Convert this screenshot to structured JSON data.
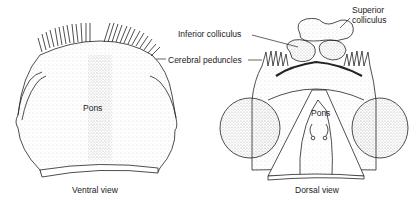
{
  "figure": {
    "ventral": {
      "caption": "Ventral view",
      "pons_label": "Pons"
    },
    "dorsal": {
      "caption": "Dorsal view",
      "pons_label": "Pons"
    },
    "callouts": {
      "superior_line1": "Superior",
      "superior_line2": "colliculus",
      "inferior": "Inferior colliculus",
      "cerebral": "Cerebral peduncles"
    }
  },
  "colors": {
    "line": "#222222",
    "stipple": "#555555",
    "background": "#ffffff"
  }
}
